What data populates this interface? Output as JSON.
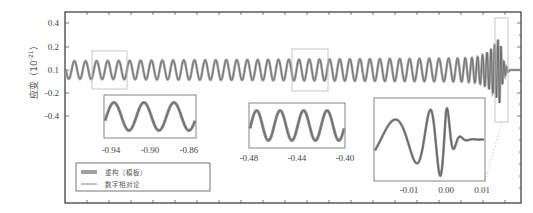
{
  "chart_data": {
    "type": "line",
    "title": "",
    "xlabel": "",
    "ylabel": "应变（10⁻²¹）",
    "ylabel_parts": {
      "main": "应变（10",
      "exp": "-21",
      "close": "）"
    },
    "yticks": [
      {
        "label": "0.4",
        "value": 0.4,
        "py": 23
      },
      {
        "label": "0.2",
        "value": 0.2,
        "py": 47
      },
      {
        "label": "0.1",
        "value": 0.1,
        "py": 70
      },
      {
        "label": "-0.2",
        "value": -0.2,
        "py": 93
      },
      {
        "label": "-0.4",
        "value": -0.4,
        "py": 116
      }
    ],
    "xlim": [
      -1.0,
      0.02
    ],
    "grid": false,
    "legend_position": "lower-left",
    "series": [
      {
        "name": "重构（模板）",
        "style": "thick-gray",
        "color": "#9a9a9a"
      },
      {
        "name": "数字相对论",
        "style": "thin-dark",
        "color": "#555555"
      }
    ],
    "insets": [
      {
        "name": "inset-early",
        "xticks": [
          "-0.94",
          "-0.90",
          "-0.86"
        ],
        "xrange": [
          -0.95,
          -0.86
        ],
        "cycles": 3
      },
      {
        "name": "inset-mid",
        "xticks": [
          "-0.48",
          "-0.44",
          "-0.40"
        ],
        "xrange": [
          -0.48,
          -0.4
        ],
        "cycles": 4
      },
      {
        "name": "inset-merger",
        "xticks": [
          "-0.01",
          "0.00",
          "0.01"
        ],
        "xrange": [
          -0.02,
          0.01
        ],
        "cycles": "chirp+ringdown"
      }
    ]
  },
  "legend": {
    "items": [
      {
        "label": "重构（模板）"
      },
      {
        "label": "数字相对论"
      }
    ]
  },
  "colors": {
    "frame": "#333333",
    "waveform": "#7a7a7a",
    "template_band": "#a0a0a0",
    "zoom_box": "#b5b5b5"
  }
}
